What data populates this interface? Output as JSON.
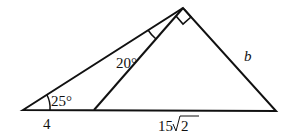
{
  "diagram": {
    "type": "geometry-triangle",
    "labels": {
      "angle_left": "25°",
      "angle_inner": "20°",
      "side_left_base": "4",
      "side_base_coef": "15",
      "side_base_radicand": "2",
      "side_right": "b"
    },
    "right_angle_at": "apex",
    "colors": {
      "stroke": "#111111",
      "background": "#ffffff"
    }
  }
}
